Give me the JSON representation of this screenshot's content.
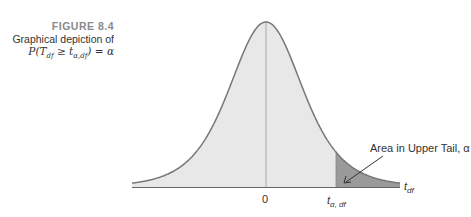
{
  "caption": {
    "figure_number": "FIGURE 8.4",
    "description": "Graphical depiction of",
    "formula": "P(Tₐ ≥ tα,df) = α"
  },
  "chart_data": {
    "type": "area",
    "distribution": "Student t density",
    "xlabel": "t_df",
    "ylabel": "",
    "x_ticks": [
      {
        "label": "0",
        "value": 0
      },
      {
        "label": "t_α, df",
        "value": 1.7
      }
    ],
    "shaded_region": {
      "from": "t_α,df",
      "to": "+∞",
      "label": "Area in Upper Tail, α"
    },
    "annotation": "Area in Upper Tail, α",
    "grid": false,
    "legend": "none",
    "colors": {
      "fill": "#e6e6e6",
      "tail": "#9a9a9a",
      "curve": "#777777"
    }
  },
  "labels": {
    "zero": "0",
    "t_alpha_main": "t",
    "t_alpha_sub": "α, df",
    "t_df_main": "t",
    "t_df_sub": "df",
    "annotation": "Area in Upper Tail, α"
  }
}
